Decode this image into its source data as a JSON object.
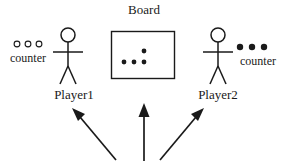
{
  "diagram": {
    "background_color": "#ffffff",
    "ink_color": "#1a1a1a",
    "board": {
      "title": "Board",
      "tokens_on_board": 4,
      "token_style": "filled",
      "token_positions": [
        {
          "x": 144,
          "y": 51
        },
        {
          "x": 124,
          "y": 62
        },
        {
          "x": 134,
          "y": 62
        },
        {
          "x": 144,
          "y": 62
        }
      ],
      "rect": {
        "x": 111,
        "y": 31,
        "width": 64,
        "height": 48
      }
    },
    "players": [
      {
        "id": "player1",
        "label": "Player1",
        "side": "left",
        "counter_label": "counter",
        "counter_count": 3,
        "counter_style": "hollow"
      },
      {
        "id": "player2",
        "label": "Player2",
        "side": "right",
        "counter_label": "counter",
        "counter_count": 3,
        "counter_style": "filled"
      }
    ],
    "arrows": [
      {
        "id": "arrow-to-player1",
        "direction": "up-left",
        "from": [
          115,
          160
        ],
        "to": [
          73,
          110
        ]
      },
      {
        "id": "arrow-to-board",
        "direction": "up",
        "from": [
          144,
          161
        ],
        "to": [
          144,
          104
        ]
      },
      {
        "id": "arrow-to-player2",
        "direction": "up-right",
        "from": [
          160,
          160
        ],
        "to": [
          203,
          110
        ]
      }
    ]
  }
}
